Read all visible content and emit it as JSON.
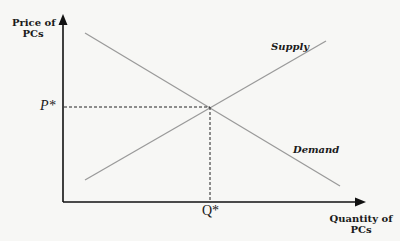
{
  "diagram": {
    "type": "supply-demand",
    "y_axis_label_line1": "Price of",
    "y_axis_label_line2": "PCs",
    "x_axis_label_line1": "Quantity of",
    "x_axis_label_line2": "PCs",
    "supply_label": "Supply",
    "demand_label": "Demand",
    "equilibrium_price_label": "P*",
    "equilibrium_quantity_label": "Q*",
    "colors": {
      "axes": "#111111",
      "curves": "#9a9a9a",
      "dashed": "#222222",
      "background": "#f7f7f5"
    },
    "curves": [
      {
        "name": "Demand",
        "from": [
          85,
          33
        ],
        "to": [
          340,
          186
        ],
        "slope": "downward"
      },
      {
        "name": "Supply",
        "from": [
          85,
          180
        ],
        "to": [
          326,
          41
        ],
        "slope": "upward"
      }
    ],
    "equilibrium_point": [
      210,
      107
    ]
  }
}
